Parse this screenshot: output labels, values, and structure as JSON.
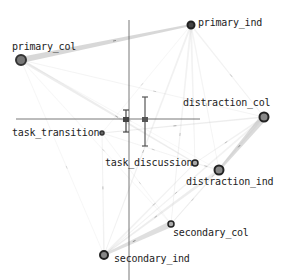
{
  "diagram": {
    "type": "network-graph",
    "axes": {
      "vertical_x": 129,
      "vertical_y_range": [
        20,
        280
      ],
      "horizontal_y": 119,
      "horizontal_x_range": [
        16,
        200
      ],
      "color": "#555555"
    },
    "error_markers": [
      {
        "x": 126,
        "y": 120,
        "y_top": 110,
        "y_bottom": 132,
        "color": "#444444"
      },
      {
        "x": 145,
        "y": 120,
        "y_top": 97,
        "y_bottom": 146,
        "color": "#555555"
      }
    ],
    "nodes": [
      {
        "id": "primary_col",
        "label": "primary_col",
        "x": 21,
        "y": 60,
        "r": 5,
        "fill": "#777777",
        "stroke": "#333333",
        "label_x": 12,
        "label_y": 41
      },
      {
        "id": "primary_ind",
        "label": "primary_ind",
        "x": 191,
        "y": 25,
        "r": 3.5,
        "fill": "#444444",
        "stroke": "#222222",
        "label_x": 198,
        "label_y": 17
      },
      {
        "id": "distraction_col",
        "label": "distraction_col",
        "x": 264,
        "y": 117,
        "r": 4.5,
        "fill": "#888888",
        "stroke": "#222222",
        "label_x": 183,
        "label_y": 97
      },
      {
        "id": "distraction_ind",
        "label": "distraction_ind",
        "x": 219,
        "y": 170,
        "r": 4.5,
        "fill": "#888888",
        "stroke": "#222222",
        "label_x": 186,
        "label_y": 176
      },
      {
        "id": "task_transition",
        "label": "task_transition",
        "x": 102,
        "y": 133,
        "r": 2,
        "fill": "#666666",
        "stroke": "#333333",
        "label_x": 12,
        "label_y": 127
      },
      {
        "id": "task_discussion",
        "label": "task_discussion",
        "x": 195,
        "y": 163,
        "r": 3,
        "fill": "#aaaaaa",
        "stroke": "#222222",
        "label_x": 105,
        "label_y": 157
      },
      {
        "id": "secondary_col",
        "label": "secondary_col",
        "x": 171,
        "y": 224,
        "r": 3,
        "fill": "#aaaaaa",
        "stroke": "#222222",
        "label_x": 173,
        "label_y": 227
      },
      {
        "id": "secondary_ind",
        "label": "secondary_ind",
        "x": 104,
        "y": 255,
        "r": 4,
        "fill": "#888888",
        "stroke": "#222222",
        "label_x": 114,
        "label_y": 253
      }
    ],
    "edges": [
      {
        "from": "primary_col",
        "to": "primary_ind",
        "width": 6,
        "opacity": 0.55
      },
      {
        "from": "primary_col",
        "to": "task_discussion",
        "width": 3,
        "opacity": 0.25
      },
      {
        "from": "primary_col",
        "to": "distraction_col",
        "width": 1,
        "opacity": 0.15
      },
      {
        "from": "primary_col",
        "to": "secondary_ind",
        "width": 1,
        "opacity": 0.12
      },
      {
        "from": "primary_col",
        "to": "secondary_col",
        "width": 1,
        "opacity": 0.12
      },
      {
        "from": "primary_col",
        "to": "distraction_ind",
        "width": 1,
        "opacity": 0.12
      },
      {
        "from": "primary_ind",
        "to": "secondary_ind",
        "width": 2,
        "opacity": 0.2
      },
      {
        "from": "primary_ind",
        "to": "secondary_col",
        "width": 2,
        "opacity": 0.18
      },
      {
        "from": "primary_ind",
        "to": "task_discussion",
        "width": 2,
        "opacity": 0.18
      },
      {
        "from": "primary_ind",
        "to": "distraction_col",
        "width": 1.5,
        "opacity": 0.18
      },
      {
        "from": "primary_ind",
        "to": "distraction_ind",
        "width": 1.5,
        "opacity": 0.15
      },
      {
        "from": "primary_ind",
        "to": "task_transition",
        "width": 1,
        "opacity": 0.12
      },
      {
        "from": "distraction_col",
        "to": "distraction_ind",
        "width": 7,
        "opacity": 0.5
      },
      {
        "from": "distraction_col",
        "to": "task_discussion",
        "width": 2,
        "opacity": 0.2
      },
      {
        "from": "distraction_col",
        "to": "secondary_ind",
        "width": 2,
        "opacity": 0.18
      },
      {
        "from": "distraction_col",
        "to": "secondary_col",
        "width": 1.5,
        "opacity": 0.15
      },
      {
        "from": "distraction_col",
        "to": "task_transition",
        "width": 1.5,
        "opacity": 0.25
      },
      {
        "from": "distraction_ind",
        "to": "secondary_ind",
        "width": 3,
        "opacity": 0.25
      },
      {
        "from": "distraction_ind",
        "to": "task_discussion",
        "width": 1.5,
        "opacity": 0.18
      },
      {
        "from": "distraction_ind",
        "to": "secondary_col",
        "width": 1,
        "opacity": 0.15
      },
      {
        "from": "secondary_col",
        "to": "secondary_ind",
        "width": 6,
        "opacity": 0.45
      },
      {
        "from": "secondary_ind",
        "to": "task_discussion",
        "width": 2,
        "opacity": 0.2
      },
      {
        "from": "secondary_ind",
        "to": "task_transition",
        "width": 1.5,
        "opacity": 0.2
      },
      {
        "from": "task_transition",
        "to": "task_discussion",
        "width": 1,
        "opacity": 0.15
      },
      {
        "from": "task_transition",
        "to": "secondary_col",
        "width": 1,
        "opacity": 0.12
      }
    ],
    "edge_color": "#b8b8b8"
  }
}
